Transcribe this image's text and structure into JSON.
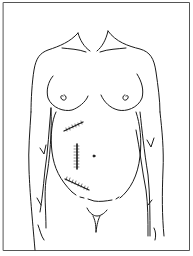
{
  "figure": {
    "caption": "Female torso line drawing showing three abdominal surgical incisions",
    "colors": {
      "background": "#ffffff",
      "line": "#1a1a1a",
      "frame": "#555555"
    },
    "incisions": [
      {
        "name": "upper-oblique-incision",
        "x1": 64,
        "y1": 131,
        "x2": 83,
        "y2": 122
      },
      {
        "name": "vertical-paramedian-incision",
        "x1": 77,
        "y1": 144,
        "x2": 77,
        "y2": 169
      },
      {
        "name": "lower-oblique-incision",
        "x1": 65,
        "y1": 179,
        "x2": 89,
        "y2": 190
      }
    ]
  }
}
